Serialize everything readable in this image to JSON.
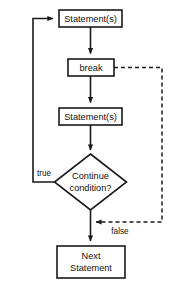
{
  "diagram": {
    "type": "flowchart",
    "colors": {
      "stroke": "#1a1a1a",
      "fill": "#ffffff",
      "text": "#111111",
      "background": "#ffffff"
    },
    "nodes": [
      {
        "id": "statements-top",
        "shape": "rectangle",
        "label": "Statement(s)",
        "x": 59,
        "y": 10,
        "width": 63,
        "height": 17
      },
      {
        "id": "break",
        "shape": "rectangle",
        "label": "break",
        "x": 68,
        "y": 59,
        "width": 46,
        "height": 17
      },
      {
        "id": "statements-bottom",
        "shape": "rectangle",
        "label": "Statement(s)",
        "x": 59,
        "y": 108,
        "width": 63,
        "height": 17
      },
      {
        "id": "continue-condition",
        "shape": "diamond",
        "label_line1": "Continue",
        "label_line2": "condition?",
        "cx": 90.5,
        "cy": 182,
        "rx": 36,
        "ry": 28
      },
      {
        "id": "next-statement",
        "shape": "rectangle",
        "label_line1": "Next",
        "label_line2": "Statement",
        "x": 57,
        "y": 246,
        "width": 68,
        "height": 32
      }
    ],
    "edge_labels": [
      {
        "id": "true-label",
        "text": "true",
        "x": 44,
        "y": 174
      },
      {
        "id": "false-label",
        "text": "false",
        "x": 120,
        "y": 232
      }
    ],
    "edges": [
      {
        "id": "edge-statements-to-break",
        "style": "solid",
        "arrow": true
      },
      {
        "id": "edge-break-to-statements",
        "style": "solid",
        "arrow": true
      },
      {
        "id": "edge-statements-to-condition",
        "style": "solid",
        "arrow": true
      },
      {
        "id": "edge-condition-true-loopback",
        "style": "solid",
        "arrow": true
      },
      {
        "id": "edge-condition-false-to-next",
        "style": "solid",
        "arrow": true
      },
      {
        "id": "edge-break-jump-dashed",
        "style": "dashed",
        "arrow": true
      }
    ]
  }
}
